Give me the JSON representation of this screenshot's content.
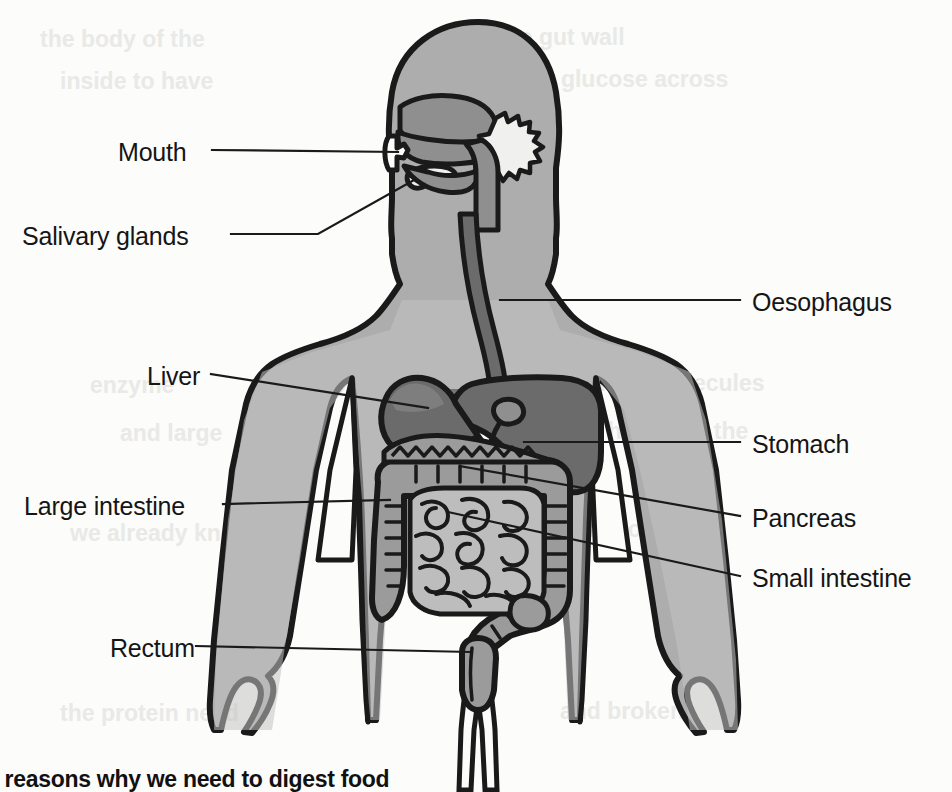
{
  "figure": {
    "type": "anatomical-diagram",
    "caption": "e reasons why we need to digest food",
    "colors": {
      "background": "#fcfcfb",
      "outline": "#1a1a1a",
      "body_fill": "#adadad",
      "body_fill_light": "#c9c9c9",
      "organ_dark": "#6b6b6b",
      "organ_mid": "#8f8f8f",
      "organ_light": "#bdbdbd",
      "salivary_gland": "#f0f0ee",
      "label_text": "#151515",
      "leader_line": "#1a1a1a"
    }
  },
  "labels": {
    "left": [
      {
        "id": "mouth",
        "text": "Mouth",
        "x": 118,
        "y": 138
      },
      {
        "id": "salivary-glands",
        "text": "Salivary glands",
        "x": 22,
        "y": 222
      },
      {
        "id": "liver",
        "text": "Liver",
        "x": 147,
        "y": 362
      },
      {
        "id": "large-intestine",
        "text": "Large intestine",
        "x": 24,
        "y": 492
      },
      {
        "id": "rectum",
        "text": "Rectum",
        "x": 110,
        "y": 634
      }
    ],
    "right": [
      {
        "id": "oesophagus",
        "text": "Oesophagus",
        "x": 752,
        "y": 288
      },
      {
        "id": "stomach",
        "text": "Stomach",
        "x": 752,
        "y": 430
      },
      {
        "id": "pancreas",
        "text": "Pancreas",
        "x": 752,
        "y": 504
      },
      {
        "id": "small-intestine",
        "text": "Small intestine",
        "x": 752,
        "y": 564
      }
    ]
  },
  "organs": [
    {
      "id": "mouth",
      "name": "Mouth"
    },
    {
      "id": "salivary-glands",
      "name": "Salivary glands"
    },
    {
      "id": "oesophagus",
      "name": "Oesophagus"
    },
    {
      "id": "liver",
      "name": "Liver"
    },
    {
      "id": "stomach",
      "name": "Stomach"
    },
    {
      "id": "pancreas",
      "name": "Pancreas"
    },
    {
      "id": "small-intestine",
      "name": "Small intestine"
    },
    {
      "id": "large-intestine",
      "name": "Large intestine"
    },
    {
      "id": "rectum",
      "name": "Rectum"
    }
  ],
  "bleed_through": [
    {
      "text": "the body of the",
      "x": 40,
      "y": 26
    },
    {
      "text": "of the  gut wall",
      "x": 470,
      "y": 24
    },
    {
      "text": "inside   to  have",
      "x": 60,
      "y": 68
    },
    {
      "text": "the  glucose  across",
      "x": 520,
      "y": 66
    },
    {
      "text": "enzyme",
      "x": 90,
      "y": 372
    },
    {
      "text": "in  small  molecules",
      "x": 560,
      "y": 370
    },
    {
      "text": "and  large",
      "x": 120,
      "y": 420
    },
    {
      "text": "the  villi  of  the",
      "x": 600,
      "y": 418
    },
    {
      "text": "we  already  know",
      "x": 70,
      "y": 520
    },
    {
      "text": "to  absorb  them",
      "x": 560,
      "y": 516
    },
    {
      "text": "the  protein  need",
      "x": 60,
      "y": 700
    },
    {
      "text": "and  broken",
      "x": 560,
      "y": 698
    }
  ]
}
